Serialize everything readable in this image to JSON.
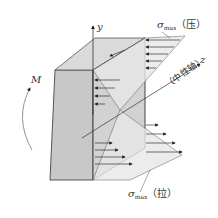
{
  "diagram": {
    "labels": {
      "y_axis": "y",
      "z_axis": "z",
      "moment": "M",
      "sigma": "σ",
      "sigma_sub": "max",
      "compression": "（压）",
      "tension": "（拉）",
      "neutral_axis": "（中性轴）"
    },
    "colors": {
      "block_front": "#c9c9c9",
      "block_top": "#dcdcdc",
      "stress_fill": "#e6e6e6",
      "line": "#444444"
    }
  }
}
